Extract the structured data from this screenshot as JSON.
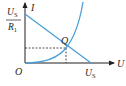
{
  "diagram": {
    "type": "I-U characteristic with load line",
    "axes": {
      "y_label": "I",
      "x_label": "U",
      "origin_label": "O"
    },
    "labels": {
      "y_intercept_numerator": "U",
      "y_intercept_numerator_sub": "S",
      "y_intercept_denominator": "R",
      "y_intercept_denominator_sub": "1",
      "x_intercept": "U",
      "x_intercept_sub": "S",
      "intersection_point": "Q"
    },
    "colors": {
      "curve": "#4a9fd8",
      "axes": "#231f20",
      "dashed": "#231f20",
      "text": "#231f20"
    }
  }
}
